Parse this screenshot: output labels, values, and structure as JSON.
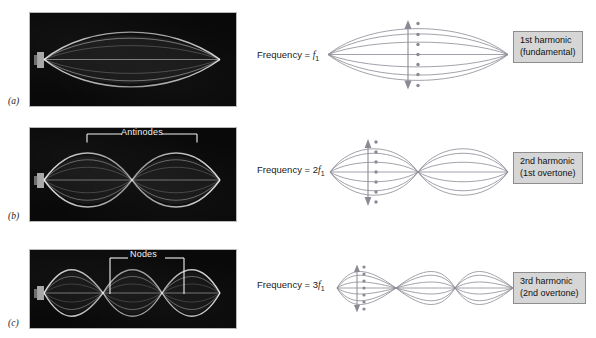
{
  "figure": {
    "background_color": "#ffffff",
    "photo_background_color": "#0a0a0a",
    "string_color": "#7a7a86",
    "label_box_fill": "#d6d6d6",
    "label_box_border": "#8d8d8d",
    "annotation_color": "#f2f2f2"
  },
  "rows": [
    {
      "panel_label": "(a)",
      "photo_annotation": null,
      "frequency_prefix": "Frequency = ",
      "frequency_coef": "",
      "frequency_symbol": "f",
      "frequency_sub": "1",
      "harmonic_name": "1st harmonic",
      "harmonic_alt": "(fundamental)",
      "loops": 1,
      "nodes": 2,
      "antinodes": 1
    },
    {
      "panel_label": "(b)",
      "photo_annotation": "Antinodes",
      "frequency_prefix": "Frequency = ",
      "frequency_coef": "2",
      "frequency_symbol": "f",
      "frequency_sub": "1",
      "harmonic_name": "2nd harmonic",
      "harmonic_alt": "(1st overtone)",
      "loops": 2,
      "nodes": 3,
      "antinodes": 2
    },
    {
      "panel_label": "(c)",
      "photo_annotation": "Nodes",
      "frequency_prefix": "Frequency = ",
      "frequency_coef": "3",
      "frequency_symbol": "f",
      "frequency_sub": "1",
      "harmonic_name": "3rd harmonic",
      "harmonic_alt": "(2nd overtone)",
      "loops": 3,
      "nodes": 4,
      "antinodes": 3
    }
  ],
  "diagram": {
    "snapshot_count": 7,
    "amplitude_dot_count": 7,
    "arrow_name": "double-headed-amplitude-arrow"
  }
}
